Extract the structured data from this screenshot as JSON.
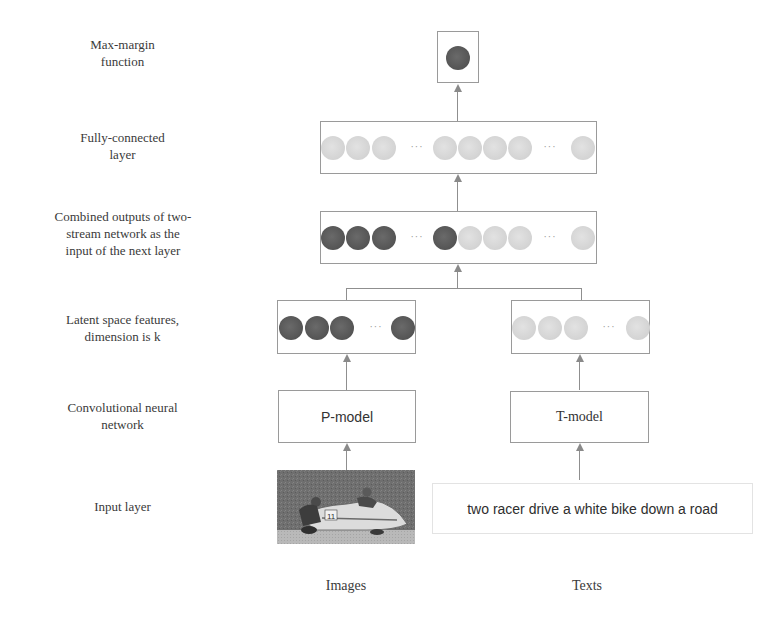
{
  "layer_labels": {
    "max_margin": [
      "Max-margin",
      "function"
    ],
    "fully_connected": [
      "Fully-connected",
      "layer"
    ],
    "combined": [
      "Combined outputs of two-",
      "stream network as the",
      "input of the next layer"
    ],
    "latent": [
      "Latent space features,",
      "dimension is k"
    ],
    "cnn": [
      "Convolutional neural",
      "network"
    ],
    "input": [
      "Input layer"
    ]
  },
  "models": {
    "image_model": "P-model",
    "text_model": "T-model"
  },
  "inputs": {
    "text_caption": "two racer drive a white bike down a road",
    "image_description": "photo of a sidecar motorcycle racing team on a road"
  },
  "stream_labels": {
    "images": "Images",
    "texts": "Texts"
  },
  "ellipsis": "···",
  "colors": {
    "image_feature": "#555555",
    "text_feature": "#d4d4d4",
    "border": "#9a9a9a",
    "arrow": "#8a8a8a"
  }
}
